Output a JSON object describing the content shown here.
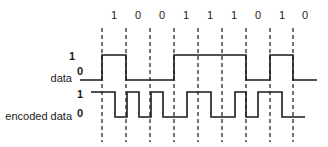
{
  "diagram": {
    "bits": [
      "1",
      "0",
      "0",
      "1",
      "1",
      "1",
      "0",
      "1",
      "0"
    ],
    "rows": {
      "data": {
        "label": "data",
        "high_label": "1",
        "low_label": "0"
      },
      "encoded": {
        "label": "encoded data",
        "high_label": "1",
        "low_label": "0"
      }
    },
    "colors": {
      "line": "#1a1a1a",
      "background": "#ffffff"
    }
  }
}
